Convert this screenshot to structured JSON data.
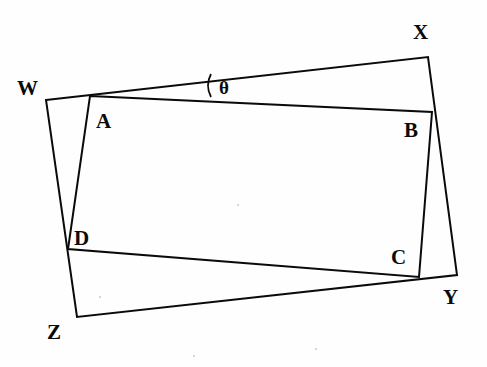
{
  "figure": {
    "background_color": "#fefefe",
    "stroke_color": "#0a0a0a",
    "stroke_width": 2.0,
    "canvas": {
      "width": 487,
      "height": 367
    }
  },
  "labels": {
    "W": "W",
    "X": "X",
    "Y": "Y",
    "Z": "Z",
    "A": "A",
    "B": "B",
    "C": "C",
    "D": "D",
    "theta": "θ"
  },
  "chart_data": {
    "type": "diagram",
    "points": {
      "W": {
        "x": 46,
        "y": 100
      },
      "X": {
        "x": 428,
        "y": 57
      },
      "Y": {
        "x": 457,
        "y": 275
      },
      "Z": {
        "x": 77,
        "y": 317
      },
      "A": {
        "x": 90,
        "y": 96
      },
      "B": {
        "x": 432,
        "y": 112
      },
      "C": {
        "x": 419,
        "y": 277
      },
      "D": {
        "x": 68,
        "y": 249
      }
    },
    "polygons": [
      {
        "name": "WXYZ",
        "vertices": [
          "W",
          "X",
          "Y",
          "Z"
        ],
        "closed": true,
        "fill": "none"
      },
      {
        "name": "ABCD",
        "vertices": [
          "A",
          "B",
          "C",
          "D"
        ],
        "closed": true,
        "fill": "none"
      }
    ],
    "segments": [
      {
        "from": "W",
        "to": "X"
      },
      {
        "from": "X",
        "to": "Y"
      },
      {
        "from": "Y",
        "to": "Z"
      },
      {
        "from": "Z",
        "to": "W"
      },
      {
        "from": "A",
        "to": "B"
      },
      {
        "from": "B",
        "to": "C"
      },
      {
        "from": "C",
        "to": "D"
      },
      {
        "from": "D",
        "to": "A"
      }
    ],
    "angle_marker": {
      "label": "θ",
      "at_vertex": "W",
      "between": [
        "WX",
        "AB"
      ],
      "arc_x": 211,
      "arc_top_y": 74,
      "arc_bottom_y": 97,
      "label_x": 219,
      "label_y": 78
    },
    "label_positions": {
      "W": {
        "x": 17,
        "y": 78
      },
      "X": {
        "x": 413,
        "y": 22
      },
      "Y": {
        "x": 443,
        "y": 287
      },
      "Z": {
        "x": 47,
        "y": 322
      },
      "A": {
        "x": 96,
        "y": 111
      },
      "B": {
        "x": 404,
        "y": 120
      },
      "C": {
        "x": 391,
        "y": 247
      },
      "D": {
        "x": 74,
        "y": 228
      }
    }
  }
}
